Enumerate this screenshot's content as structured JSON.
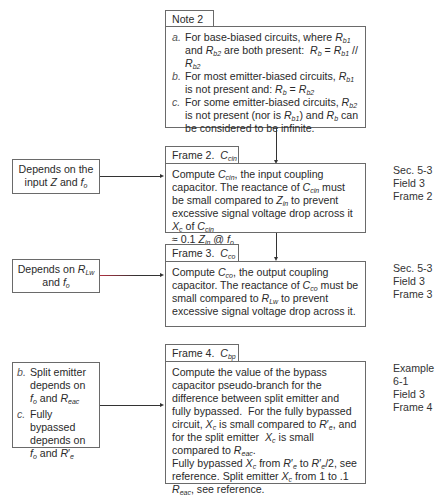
{
  "note": {
    "title": "Note 2",
    "items": [
      {
        "marker": "a.",
        "text": "For base-biased circuits, where R_b1 and R_b2 are both present: R_b = R_b1 // R_b2"
      },
      {
        "marker": "b.",
        "text": "For most emitter-biased circuits, R_b1 is not present and: R_b = R_b2"
      },
      {
        "marker": "c.",
        "text": "For some emitter-biased circuits, R_b2 is not present (nor is R_b1) and R_b can be considered to be infinite."
      }
    ]
  },
  "frames": [
    {
      "title": "Frame 2.",
      "symbol": "C_cin",
      "text": "Compute C_cin, the input coupling capacitor. The reactance of C_cin must be small compared to Z_in to prevent excessive signal voltage drop across it X_c of C_cin ≈ 0.1 Z_in @ f_o",
      "input": "Depends on the input Z and f_o",
      "reference": [
        "Sec. 5-3",
        "Field 3",
        "Frame 2"
      ]
    },
    {
      "title": "Frame 3.",
      "symbol": "C_co",
      "text": "Compute C_co, the output coupling capacitor. The reactance of C_co must be small compared to R_Lw to prevent excessive signal voltage drop across it.",
      "input": "Depends on R_Lw and f_o",
      "reference": [
        "Sec. 5-3",
        "Field 3",
        "Frame 3"
      ]
    },
    {
      "title": "Frame 4.",
      "symbol": "C_bp",
      "text": "Compute the value of the bypass capacitor pseudo-branch for the difference between split emitter and fully bypassed. For the fully bypassed circuit, X_c is small compared to R'_e, and for the split emitter X_c is small compared to R_eac. Fully bypassed X_c from R'_e to R'_e/2, see reference. Split emitter X_c from 1 to .1 R_eac, see reference.",
      "input_items": [
        {
          "marker": "b.",
          "text": "Split emitter depends on f_o and R_eac"
        },
        {
          "marker": "c.",
          "text": "Fully bypassed depends on f_o and R'_e"
        }
      ],
      "reference": [
        "Example 6-1",
        "Field 3",
        "Frame 4"
      ]
    }
  ],
  "labels": {
    "note_title": "Note 2",
    "f2_title": "Frame 2.",
    "f3_title": "Frame 3.",
    "f4_title": "Frame 4.",
    "ref2_0": "Sec. 5-3",
    "ref2_1": "Field 3",
    "ref2_2": "Frame 2",
    "ref3_0": "Sec. 5-3",
    "ref3_1": "Field 3",
    "ref3_2": "Frame 3",
    "ref4_0": "Example 6-1",
    "ref4_1": "Field 3",
    "ref4_2": "Frame 4"
  }
}
